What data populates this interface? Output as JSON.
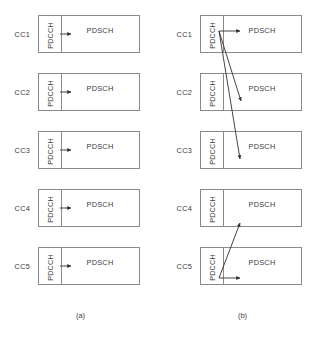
{
  "figure": {
    "panels": [
      {
        "id": "a",
        "caption": "(a)",
        "scheduling": "self-carrier",
        "rows": [
          {
            "cc_label": "CC1",
            "pdcch_label": "PDCCH",
            "pdsch_label": "PDSCH"
          },
          {
            "cc_label": "CC2",
            "pdcch_label": "PDCCH",
            "pdsch_label": "PDSCH"
          },
          {
            "cc_label": "CC3",
            "pdcch_label": "PDCCH",
            "pdsch_label": "PDSCH"
          },
          {
            "cc_label": "CC4",
            "pdcch_label": "PDCCH",
            "pdsch_label": "PDSCH"
          },
          {
            "cc_label": "CC5",
            "pdcch_label": "PDCCH",
            "pdsch_label": "PDSCH"
          }
        ]
      },
      {
        "id": "b",
        "caption": "(b)",
        "scheduling": "cross-carrier",
        "rows": [
          {
            "cc_label": "CC1",
            "pdcch_label": "PDCCH",
            "pdsch_label": "PDSCH"
          },
          {
            "cc_label": "CC2",
            "pdcch_label": "PDCCH",
            "pdsch_label": "PDSCH"
          },
          {
            "cc_label": "CC3",
            "pdcch_label": "PDCCH",
            "pdsch_label": "PDSCH"
          },
          {
            "cc_label": "CC4",
            "pdcch_label": "PDCCH",
            "pdsch_label": "PDSCH"
          },
          {
            "cc_label": "CC5",
            "pdcch_label": "PDCCH",
            "pdsch_label": "PDSCH"
          }
        ]
      }
    ],
    "colors": {
      "line": "#8a8a8a",
      "arrow": "#2f2f2f",
      "text": "#3b3b3b",
      "background": "#ffffff"
    },
    "geometry": {
      "row_tops": [
        15,
        73,
        131,
        189,
        247
      ],
      "row_height": 38,
      "box_left": 38,
      "box_width": 102,
      "pdcch_width": 22
    }
  }
}
